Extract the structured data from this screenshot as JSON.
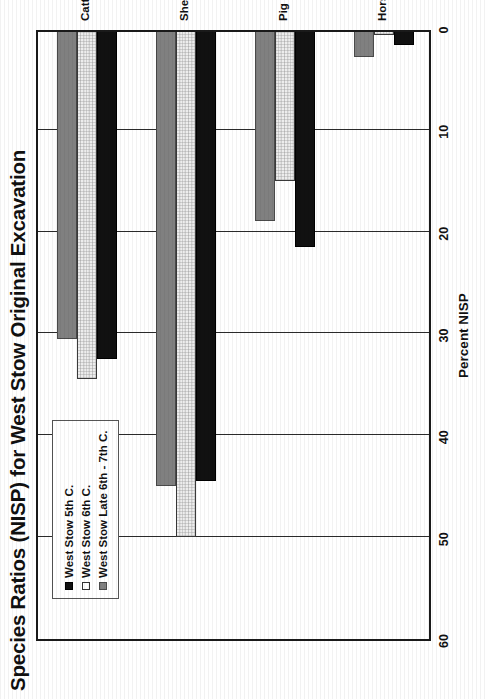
{
  "chart_data": {
    "type": "bar",
    "orientation": "horizontal",
    "title": "Species Ratios (NISP) for West Stow Original Excavation",
    "xlabel": "",
    "ylabel": "Percent NISP",
    "categories": [
      "Cattle",
      "Sheep / Goat",
      "Pig",
      "Horse"
    ],
    "series": [
      {
        "name": "West Stow 5th C.",
        "color": "#111111",
        "values": [
          32.5,
          44.5,
          21.5,
          1.7
        ]
      },
      {
        "name": "West Stow 6th C.",
        "color": "#ededed",
        "values": [
          34.5,
          50.0,
          15.0,
          0.7
        ]
      },
      {
        "name": "West Stow Late 6th - 7th C.",
        "color": "#808080",
        "values": [
          30.5,
          45.0,
          19.0,
          2.8
        ]
      }
    ],
    "value_axis": {
      "label": "Percent NISP",
      "ticks": [
        60,
        50,
        40,
        30,
        20,
        10,
        0
      ],
      "lim": [
        0,
        60
      ],
      "reversed": true
    },
    "grid": true,
    "legend_position": "upper-left"
  },
  "page": {
    "title": "Species Ratios (NISP) for West Stow Original Excavation",
    "axis_title": "Percent NISP",
    "tick_labels": [
      "60",
      "50",
      "40",
      "30",
      "20",
      "10",
      "0"
    ],
    "category_labels": [
      "Cattle",
      "Sheep / Goat",
      "Pig",
      "Horse"
    ],
    "legend": {
      "items": [
        {
          "label": "West Stow 5th C.",
          "swatch": "filled-black-square-icon"
        },
        {
          "label": "West Stow 6th C.",
          "swatch": "outline-white-square-icon"
        },
        {
          "label": "West Stow Late 6th - 7th C.",
          "swatch": "filled-gray-square-icon"
        }
      ]
    }
  }
}
